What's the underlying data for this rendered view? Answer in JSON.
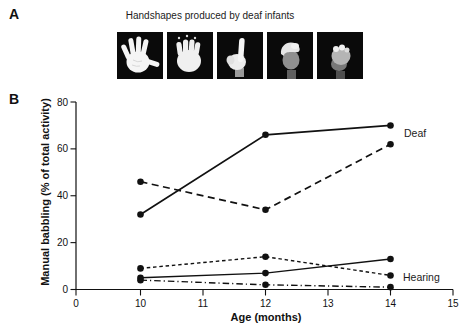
{
  "figure": {
    "panel_a": {
      "label": "A",
      "title": "Handshapes produced by deaf infants",
      "handshapes": [
        "open-palm-fingers-spread",
        "open-palm-fingers-together",
        "index-finger-pointing-up",
        "curved-claw-hand",
        "closed-fist"
      ]
    },
    "panel_b": {
      "label": "B",
      "group_labels": {
        "deaf": "Deaf",
        "hearing": "Hearing"
      }
    }
  },
  "chart_data": {
    "type": "line",
    "title": "",
    "xlabel": "Age (months)",
    "ylabel": "Manual babbling (% of total activity)",
    "x": [
      10,
      12,
      14
    ],
    "x_ticks": [
      0,
      10,
      11,
      12,
      13,
      14,
      15
    ],
    "y_ticks": [
      0,
      20,
      40,
      60,
      80
    ],
    "xlim": [
      0,
      15
    ],
    "ylim": [
      0,
      80
    ],
    "grid": false,
    "legend_position": "right-of-line-ends",
    "line_color": "#111111",
    "marker": "filled-circle",
    "series": [
      {
        "group": "Deaf",
        "style": "solid",
        "values": [
          32,
          66,
          70
        ]
      },
      {
        "group": "Deaf",
        "style": "dashed",
        "values": [
          46,
          34,
          62
        ]
      },
      {
        "group": "Hearing",
        "style": "short-dash",
        "values": [
          9,
          14,
          6
        ]
      },
      {
        "group": "Hearing",
        "style": "solid",
        "values": [
          5,
          7,
          13
        ]
      },
      {
        "group": "Hearing",
        "style": "dash-dot",
        "values": [
          4,
          2,
          1
        ]
      }
    ]
  }
}
